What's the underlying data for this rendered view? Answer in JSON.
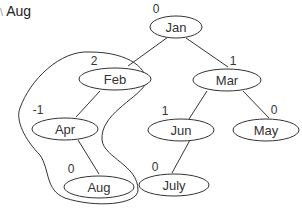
{
  "caption": {
    "marker": "\\",
    "text": "Aug"
  },
  "tree": {
    "nodes": [
      {
        "id": "jan",
        "label": "Jan",
        "balance": "0"
      },
      {
        "id": "feb",
        "label": "Feb",
        "balance": "2"
      },
      {
        "id": "mar",
        "label": "Mar",
        "balance": "1"
      },
      {
        "id": "apr",
        "label": "Apr",
        "balance": "-1"
      },
      {
        "id": "jun",
        "label": "Jun",
        "balance": "1"
      },
      {
        "id": "may",
        "label": "May",
        "balance": "0"
      },
      {
        "id": "aug",
        "label": "Aug",
        "balance": "0"
      },
      {
        "id": "july",
        "label": "July",
        "balance": "0"
      }
    ],
    "edges": [
      [
        "jan",
        "feb"
      ],
      [
        "jan",
        "mar"
      ],
      [
        "feb",
        "apr"
      ],
      [
        "apr",
        "aug"
      ],
      [
        "mar",
        "jun"
      ],
      [
        "mar",
        "may"
      ],
      [
        "jun",
        "july"
      ]
    ],
    "highlighted_subtree": [
      "feb",
      "apr",
      "aug"
    ]
  },
  "colors": {
    "stroke": "#333333",
    "text": "#333333"
  }
}
